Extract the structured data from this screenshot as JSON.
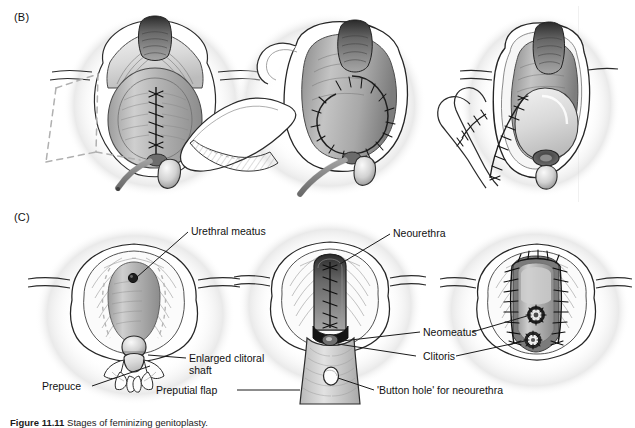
{
  "figure": {
    "panels": [
      {
        "id": "B",
        "letter": "(B)"
      },
      {
        "id": "C",
        "letter": "(C)"
      }
    ],
    "caption": {
      "number": "Figure 11.11",
      "rest": "  Stages of feminizing genitoplasty."
    }
  },
  "labels": {
    "urethral_meatus": "Urethral meatus",
    "enlarged_clitoral_shaft_line1": "Enlarged clitoral",
    "enlarged_clitoral_shaft_line2": "shaft",
    "prepuce": "Prepuce",
    "preputial_flap": "Preputial flap",
    "neourethra": "Neourethra",
    "neomeatus": "Neomeatus",
    "clitoris": "Clitoris",
    "button_hole": "'Button hole' for neourethra"
  },
  "illustrations": {
    "b_left": {
      "name": "perineum-with-midline-suture-line-and-dashed-flap-outline-and-catheter"
    },
    "b_middle": {
      "name": "mobilized-flap-retracted-laterally-with-sutured-margin-and-catheter"
    },
    "b_right": {
      "name": "closed-perineum-with-sutured-flap-strip-beside-introitus"
    },
    "c_left": {
      "name": "vulva-with-urethral-meatus-and-enlarged-clitoral-shaft-with-prepuce"
    },
    "c_middle": {
      "name": "vulva-with-sutured-neourethra-and-preputial-flap-with-button-hole"
    },
    "c_right": {
      "name": "completed-vulva-with-sutured-labia-neomeatus-and-clitoris-rosettes"
    }
  },
  "style": {
    "ink": "#1a1a1a",
    "mid_gray": "#8f8f8f",
    "light_gray": "#c9c9c9",
    "dashed_gray": "#b0b0b0",
    "shade_dark": "#4a4a4a",
    "background": "#ffffff"
  }
}
